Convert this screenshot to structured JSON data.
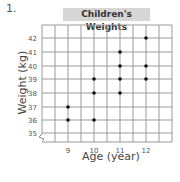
{
  "question_number": "1.",
  "chart_data": {
    "type": "scatter",
    "title": "Children's Weights",
    "xlabel": "Age (year)",
    "ylabel": "Weight (kg)",
    "x_ticks": [
      9,
      10,
      11,
      12
    ],
    "y_ticks": [
      35,
      36,
      37,
      38,
      39,
      40,
      41,
      42
    ],
    "ylim": [
      35,
      42
    ],
    "grid": true,
    "axis_break": "y-axis zigzag below 35",
    "points": [
      {
        "x": 9,
        "y": 36
      },
      {
        "x": 9,
        "y": 37
      },
      {
        "x": 10,
        "y": 36
      },
      {
        "x": 10,
        "y": 38
      },
      {
        "x": 10,
        "y": 39
      },
      {
        "x": 11,
        "y": 38
      },
      {
        "x": 11,
        "y": 39
      },
      {
        "x": 11,
        "y": 40
      },
      {
        "x": 11,
        "y": 41
      },
      {
        "x": 12,
        "y": 39
      },
      {
        "x": 12,
        "y": 40
      },
      {
        "x": 12,
        "y": 42
      }
    ]
  }
}
